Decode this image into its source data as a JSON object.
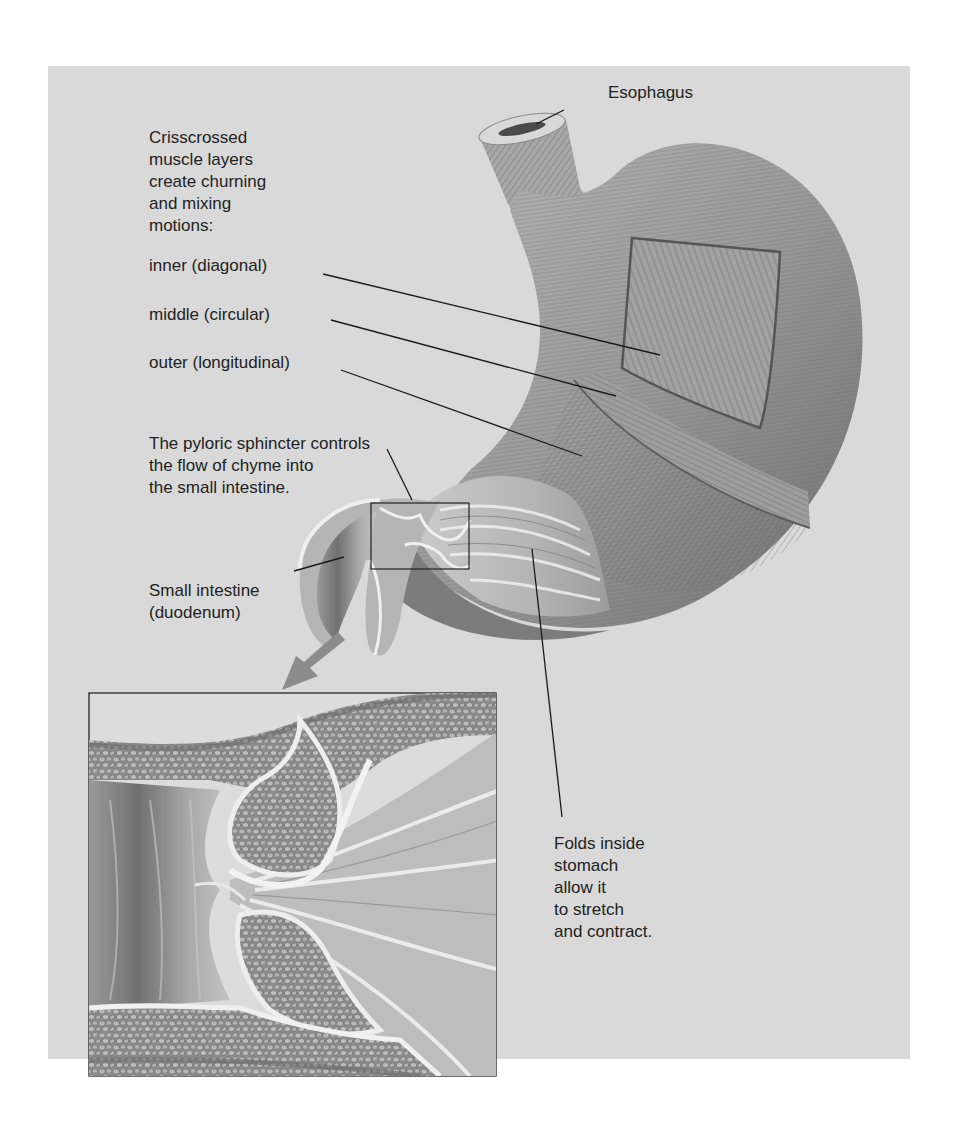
{
  "figure": {
    "background_color": "#d9d9d9",
    "labels": {
      "esophagus": "Esophagus",
      "intro": [
        "Crisscrossed",
        "muscle layers",
        "create churning",
        "and mixing",
        "motions:"
      ],
      "inner": "inner (diagonal)",
      "middle": "middle (circular)",
      "outer": "outer (longitudinal)",
      "pyloric": [
        "The pyloric sphincter controls",
        "the flow of chyme into",
        "the small intestine."
      ],
      "small_intestine": [
        "Small intestine",
        "(duodenum)"
      ],
      "folds": [
        "Folds inside",
        "stomach",
        "allow it",
        "to stretch",
        "and contract."
      ]
    }
  }
}
